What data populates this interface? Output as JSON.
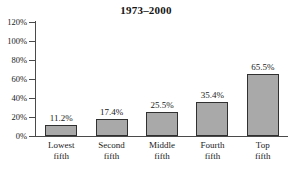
{
  "chart_data": {
    "type": "bar",
    "title": "1973–2000",
    "subtitle": "",
    "xlabel": "",
    "ylabel": "",
    "categories": [
      "Lowest fifth",
      "Second fifth",
      "Middle fifth",
      "Fourth fifth",
      "Top fifth"
    ],
    "category_lines": [
      [
        "Lowest",
        "fifth"
      ],
      [
        "Second",
        "fifth"
      ],
      [
        "Middle",
        "fifth"
      ],
      [
        "Fourth",
        "fifth"
      ],
      [
        "Top",
        "fifth"
      ]
    ],
    "values": [
      11.2,
      17.4,
      25.5,
      35.4,
      65.5
    ],
    "value_labels": [
      "11.2%",
      "17.4%",
      "25.5%",
      "35.4%",
      "65.5%"
    ],
    "ylim": [
      0,
      120
    ],
    "ytick_values": [
      0,
      20,
      40,
      60,
      80,
      100,
      120
    ],
    "ytick_labels": [
      "0%",
      "20%",
      "40%",
      "60%",
      "80%",
      "100%",
      "120%"
    ],
    "grid": false,
    "legend": false,
    "legend_position": "none",
    "bar_fill_color": "#a9a9a9",
    "bar_border_color": "#303030",
    "axis_color": "#4a4a4a",
    "text_color": "#1a1a1a",
    "background_color": "#ffffff"
  }
}
